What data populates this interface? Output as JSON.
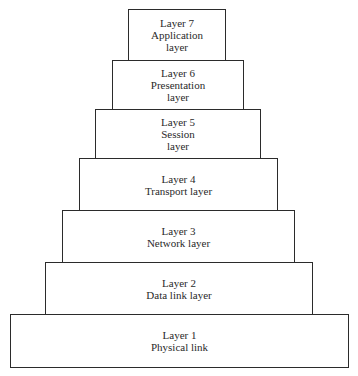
{
  "diagram": {
    "type": "stacked-pyramid",
    "layers": [
      {
        "number": 7,
        "title": "Layer 7",
        "lines": [
          "Application",
          "layer"
        ]
      },
      {
        "number": 6,
        "title": "Layer 6",
        "lines": [
          "Presentation",
          "layer"
        ]
      },
      {
        "number": 5,
        "title": "Layer 5",
        "lines": [
          "Session",
          "layer"
        ]
      },
      {
        "number": 4,
        "title": "Layer 4",
        "lines": [
          "Transport layer"
        ]
      },
      {
        "number": 3,
        "title": "Layer 3",
        "lines": [
          "Network layer"
        ]
      },
      {
        "number": 2,
        "title": "Layer 2",
        "lines": [
          "Data link layer"
        ]
      },
      {
        "number": 1,
        "title": "Layer 1",
        "lines": [
          "Physical link"
        ]
      }
    ],
    "colors": {
      "border": "#2b2b2b",
      "fill": "#ffffff",
      "text": "#2a2a2a"
    }
  }
}
